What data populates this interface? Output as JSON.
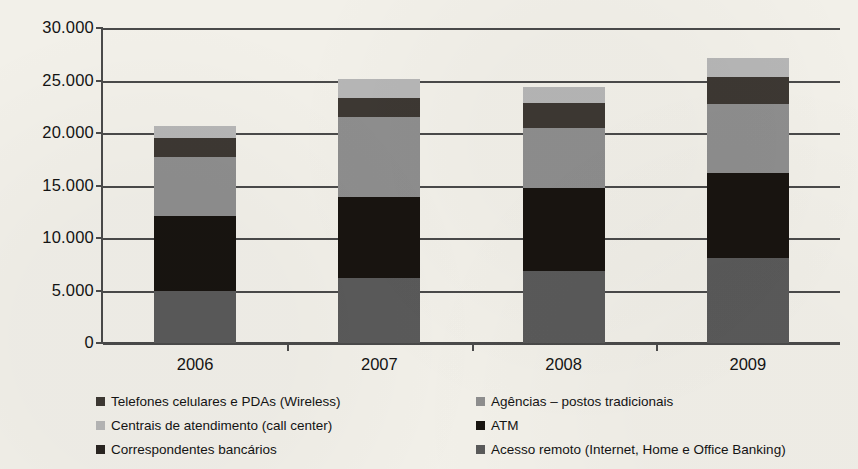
{
  "chart_data": {
    "type": "bar",
    "stacked": true,
    "title": "",
    "subtitle": "",
    "xlabel": "",
    "ylabel": "",
    "categories": [
      "2006",
      "2007",
      "2008",
      "2009"
    ],
    "ylim": [
      0,
      30000
    ],
    "ytick_labels": [
      "30.000",
      "25.000",
      "20.000",
      "15.000",
      "10.000",
      "5.000",
      "0"
    ],
    "ytick_values": [
      30000,
      25000,
      20000,
      15000,
      10000,
      5000,
      0
    ],
    "grid": true,
    "grid_axis": "y",
    "legend_position": "bottom",
    "stack_order_bottom_to_top": [
      "Acesso remoto (Internet, Home e Office Banking)",
      "ATM",
      "Agências – postos tradicionais",
      "Telefones celulares e PDAs (Wireless)",
      "Centrais de atendimento (call center)"
    ],
    "series": [
      {
        "name": "Acesso remoto (Internet, Home e Office Banking)",
        "color": "#5a5a5a",
        "values": [
          5000,
          6200,
          6900,
          8100
        ]
      },
      {
        "name": "ATM",
        "color": "#181410",
        "values": [
          7100,
          7700,
          7900,
          8100
        ]
      },
      {
        "name": "Agências – postos tradicionais",
        "color": "#8e8e8e",
        "values": [
          5600,
          7600,
          5700,
          6600
        ]
      },
      {
        "name": "Telefones celulares e PDAs (Wireless)",
        "color": "#3d3833",
        "values": [
          1800,
          1800,
          2400,
          2500
        ]
      },
      {
        "name": "Centrais de atendimento (call center)",
        "color": "#b6b6b6",
        "values": [
          1200,
          1800,
          1500,
          1800
        ]
      }
    ],
    "totals": [
      20700,
      23300,
      24400,
      27100
    ],
    "cumulative_tops": [
      [
        5000,
        12100,
        17700,
        19500,
        20700
      ],
      [
        6200,
        13900,
        21500,
        23300,
        23300
      ],
      [
        6900,
        14800,
        20500,
        22900,
        24400
      ],
      [
        8100,
        16200,
        22800,
        25300,
        27100
      ]
    ]
  },
  "legend": {
    "left_column": [
      {
        "label": "Telefones celulares e PDAs (Wireless)",
        "color": "#3d3833"
      },
      {
        "label": "Centrais de atendimento (call center)",
        "color": "#b6b6b6"
      },
      {
        "label": "Correspondentes bancários",
        "color": "#2a2521"
      }
    ],
    "right_column": [
      {
        "label": "Agências – postos tradicionais",
        "color": "#8e8e8e"
      },
      {
        "label": "ATM",
        "color": "#181410"
      },
      {
        "label": "Acesso remoto (Internet, Home e Office Banking)",
        "color": "#5a5a5a"
      }
    ]
  },
  "colors": {
    "background": "#f2f0e9",
    "axis": "#4a4a4a",
    "text": "#141414"
  }
}
